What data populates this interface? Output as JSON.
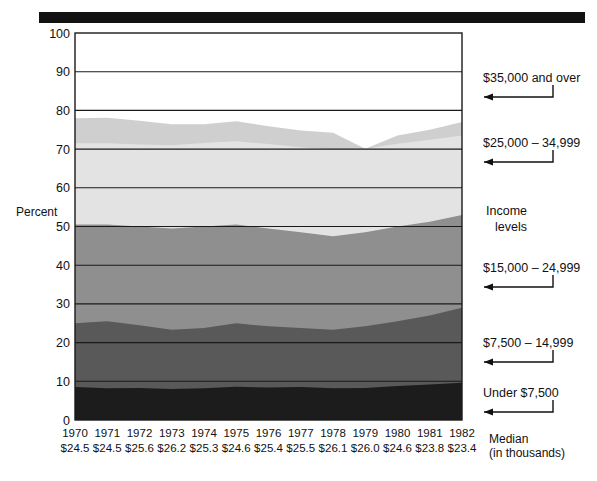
{
  "figure": {
    "top_bar": "solid-black-banner"
  },
  "axes": {
    "y_title": "Percent",
    "y_ticks": [
      0,
      10,
      20,
      30,
      40,
      50,
      60,
      70,
      80,
      90,
      100
    ],
    "y_min": 0,
    "y_max": 100,
    "x_label_row": "years",
    "median_row_label_line1": "Median",
    "median_row_label_line2": "(in thousands)"
  },
  "legend": {
    "title_line1": "Income",
    "title_line2": "levels",
    "items": [
      {
        "label": "$35,000 and over",
        "color": "#ffffff"
      },
      {
        "label": "$25,000 – 34,999",
        "color": "#dcdcdc"
      },
      {
        "label": "$15,000 – 24,999",
        "color": "#ebebeb"
      },
      {
        "label": "$7,500 – 14,999",
        "color": "#a9a9a9"
      },
      {
        "label": "Under $7,500",
        "color": "#1c1c1c"
      }
    ]
  },
  "chart_data": {
    "type": "area",
    "stacked": true,
    "title": "",
    "xlabel": "",
    "ylabel": "Percent",
    "ylim": [
      0,
      100
    ],
    "grid": true,
    "legend_position": "right",
    "categories": [
      1970,
      1971,
      1972,
      1973,
      1974,
      1975,
      1976,
      1977,
      1978,
      1979,
      1980,
      1981,
      1982
    ],
    "median_income_thousands": [
      "$24.5",
      "$24.5",
      "$25.6",
      "$26.2",
      "$25.3",
      "$24.6",
      "$25.4",
      "$25.5",
      "$26.1",
      "$26.0",
      "$24.6",
      "$23.8",
      "$23.4"
    ],
    "series": [
      {
        "name": "Under $7,500",
        "color": "#1c1c1c",
        "values": [
          8.5,
          8.2,
          8.3,
          8.0,
          8.2,
          8.6,
          8.4,
          8.5,
          8.2,
          8.3,
          8.8,
          9.2,
          9.6
        ]
      },
      {
        "name": "$7,500 – 14,999",
        "color": "#595959",
        "values": [
          16.5,
          17.3,
          16.2,
          15.3,
          15.6,
          16.4,
          15.8,
          15.3,
          15.1,
          15.9,
          16.7,
          17.8,
          19.4
        ]
      },
      {
        "name": "$15,000 – 24,999",
        "color": "#8f8f8f",
        "values": [
          25.5,
          25.0,
          25.5,
          26.2,
          26.2,
          25.5,
          25.3,
          24.7,
          24.2,
          24.3,
          24.5,
          24.2,
          24.0
        ]
      },
      {
        "name": "$25,000 – 34,999",
        "color": "#e3e3e3",
        "values": [
          21.0,
          21.0,
          21.2,
          21.5,
          21.6,
          21.5,
          21.8,
          22.0,
          22.3,
          21.6,
          21.4,
          21.2,
          20.5
        ]
      },
      {
        "name": "$35,000 and over",
        "color": "#cfcfcf",
        "values": [
          6.5,
          6.6,
          6.1,
          5.4,
          4.8,
          5.2,
          4.6,
          4.3,
          4.4,
          0.0,
          2.1,
          2.6,
          3.5
        ]
      }
    ],
    "cumulative_tops": {
      "under_7500": [
        8.5,
        8.2,
        8.3,
        8.0,
        8.2,
        8.6,
        8.4,
        8.5,
        8.2,
        8.3,
        8.8,
        9.2,
        9.6
      ],
      "to_14999": [
        25.0,
        25.5,
        24.5,
        23.3,
        23.8,
        25.0,
        24.2,
        23.8,
        23.3,
        24.2,
        25.5,
        27.0,
        29.0
      ],
      "to_24999": [
        50.5,
        50.5,
        50.0,
        49.5,
        50.0,
        50.5,
        49.5,
        48.5,
        47.5,
        48.5,
        50.0,
        51.2,
        53.0
      ],
      "to_34999": [
        71.5,
        71.5,
        71.2,
        71.0,
        71.6,
        72.0,
        71.3,
        70.5,
        69.8,
        70.1,
        71.4,
        72.4,
        73.5
      ],
      "total_top": [
        78.0,
        78.1,
        77.3,
        76.4,
        76.4,
        77.2,
        75.9,
        74.8,
        74.2,
        70.1,
        73.5,
        75.0,
        77.0
      ]
    }
  }
}
